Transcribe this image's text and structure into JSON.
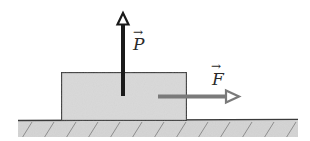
{
  "diagram": {
    "title": "",
    "vectors": [
      {
        "id": "P",
        "label": "P",
        "direction": "up",
        "color": "#1a1a1a",
        "head": "hollow-triangle"
      },
      {
        "id": "F",
        "label": "F",
        "direction": "right",
        "color": "#7a7a7a",
        "head": "hollow-triangle"
      }
    ],
    "block": {
      "fill": "#d9d9d9",
      "stroke": "#3a3a3a"
    },
    "ground": {
      "fill": "#d2d2d2",
      "stroke": "#3a3a3a",
      "hatch_color": "#8a8a8a"
    },
    "vector_arrow_symbol": "→"
  }
}
